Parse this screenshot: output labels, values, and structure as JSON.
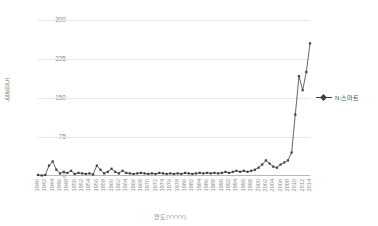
{
  "chart_data": {
    "type": "line",
    "title": "",
    "xlabel": "연도(YYYY)",
    "ylabel": "논문빈도",
    "ylim": [
      0,
      300
    ],
    "yticks": [
      0,
      75,
      150,
      225,
      300
    ],
    "xlim": [
      1940,
      2014
    ],
    "grid": true,
    "legend_position": "right",
    "series": [
      {
        "name": "N:스마트",
        "color": "#3f3f3f",
        "marker": "diamond",
        "x": [
          1940,
          1941,
          1942,
          1943,
          1944,
          1945,
          1946,
          1947,
          1948,
          1949,
          1950,
          1951,
          1952,
          1953,
          1954,
          1955,
          1956,
          1957,
          1958,
          1959,
          1960,
          1961,
          1962,
          1963,
          1964,
          1965,
          1966,
          1967,
          1968,
          1969,
          1970,
          1971,
          1972,
          1973,
          1974,
          1975,
          1976,
          1977,
          1978,
          1979,
          1980,
          1981,
          1982,
          1983,
          1984,
          1985,
          1986,
          1987,
          1988,
          1989,
          1990,
          1991,
          1992,
          1993,
          1994,
          1995,
          1996,
          1997,
          1998,
          1999,
          2000,
          2001,
          2002,
          2003,
          2004,
          2005,
          2006,
          2007,
          2008,
          2009,
          2010,
          2011,
          2012,
          2013,
          2014
        ],
        "values": [
          2,
          1,
          2,
          20,
          28,
          12,
          5,
          8,
          6,
          10,
          4,
          6,
          5,
          4,
          5,
          3,
          20,
          12,
          5,
          8,
          14,
          8,
          5,
          10,
          6,
          5,
          4,
          5,
          6,
          5,
          4,
          5,
          4,
          6,
          5,
          4,
          5,
          4,
          5,
          4,
          6,
          5,
          4,
          5,
          6,
          5,
          6,
          5,
          6,
          5,
          6,
          8,
          6,
          8,
          10,
          8,
          10,
          8,
          10,
          12,
          16,
          22,
          30,
          24,
          18,
          16,
          22,
          26,
          30,
          45,
          118,
          192,
          165,
          200,
          255
        ]
      }
    ],
    "xtick_labels": [
      "1940",
      "1942",
      "1944",
      "1946",
      "1948",
      "1950",
      "1952",
      "1954",
      "1956",
      "1958",
      "1960",
      "1962",
      "1964",
      "1966",
      "1968",
      "1970",
      "1972",
      "1974",
      "1976",
      "1978",
      "1980",
      "1982",
      "1984",
      "1986",
      "1988",
      "1990",
      "1992",
      "1994",
      "1996",
      "1998",
      "2000",
      "2002",
      "2004",
      "2006",
      "2008",
      "2010",
      "2012",
      "2014"
    ],
    "xtick_values": [
      1940,
      1942,
      1944,
      1946,
      1948,
      1950,
      1952,
      1954,
      1956,
      1958,
      1960,
      1962,
      1964,
      1966,
      1968,
      1970,
      1972,
      1974,
      1976,
      1978,
      1980,
      1982,
      1984,
      1986,
      1988,
      1990,
      1992,
      1994,
      1996,
      1998,
      2000,
      2002,
      2004,
      2006,
      2008,
      2010,
      2012,
      2014
    ]
  },
  "legend": {
    "entries": [
      {
        "label": "N:스마트"
      }
    ]
  },
  "axes": {
    "y_title": "논문빈도",
    "x_title": "연도(YYYY)"
  }
}
